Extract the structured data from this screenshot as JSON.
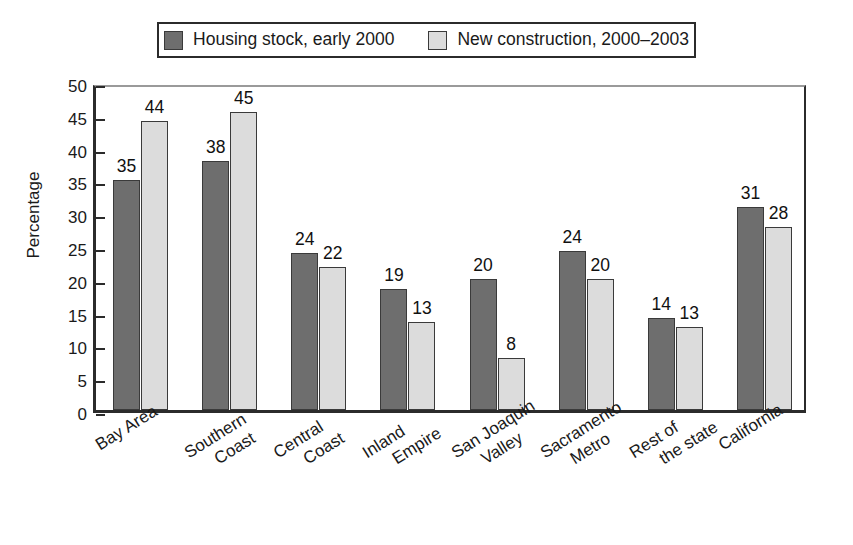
{
  "chart_data": {
    "type": "bar",
    "title": "",
    "xlabel": "",
    "ylabel": "Percentage",
    "ylim": [
      0,
      50
    ],
    "yticks": [
      0,
      5,
      10,
      15,
      20,
      25,
      30,
      35,
      40,
      45,
      50
    ],
    "grid": false,
    "legend_position": "top-center",
    "categories": [
      "Bay Area",
      "Southern Coast",
      "Central Coast",
      "Inland Empire",
      "San Joaquin Valley",
      "Sacramento Metro",
      "Rest of the state",
      "California"
    ],
    "category_lines": [
      [
        "Bay Area"
      ],
      [
        "Southern",
        "Coast"
      ],
      [
        "Central",
        "Coast"
      ],
      [
        "Inland",
        "Empire"
      ],
      [
        "San Joaquin",
        "Valley"
      ],
      [
        "Sacramento",
        "Metro"
      ],
      [
        "Rest of",
        "the state"
      ],
      [
        "California"
      ]
    ],
    "series": [
      {
        "name": "Housing stock, early 2000",
        "color": "#6e6e6e",
        "values": [
          35,
          38,
          24,
          19,
          20,
          24,
          14,
          31
        ],
        "plotted": [
          35,
          38,
          24,
          18.5,
          20,
          24.3,
          14,
          31
        ]
      },
      {
        "name": "New construction, 2000–2003",
        "color": "#dcdcdc",
        "values": [
          44,
          45,
          22,
          13,
          8,
          20,
          13,
          28
        ],
        "plotted": [
          44,
          45.5,
          21.8,
          13.4,
          8,
          20,
          12.7,
          27.9
        ]
      }
    ]
  },
  "legend": {
    "entries": [
      {
        "label": "Housing stock, early 2000",
        "swatch": "dark"
      },
      {
        "label": "New construction, 2000–2003",
        "swatch": "light"
      }
    ]
  },
  "axis": {
    "y_title": "Percentage"
  }
}
